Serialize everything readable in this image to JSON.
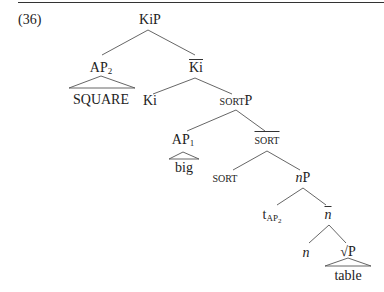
{
  "example": {
    "number": "(36)"
  },
  "tree": {
    "nodes": {
      "root": "KiP",
      "ap2": {
        "base": "AP",
        "sub": "2"
      },
      "ki_bar": "Ki",
      "square": "SQUARE",
      "ki": "Ki",
      "sortp": {
        "small_caps": "SORT",
        "suffix": "P"
      },
      "ap1": {
        "base": "AP",
        "sub": "1"
      },
      "sort_bar": "SORT",
      "big": "big",
      "sort": "SORT",
      "np": {
        "italic": "n",
        "suffix": "P"
      },
      "trace": {
        "base": "t",
        "sub_base": "AP",
        "sub_sub": "2"
      },
      "n_bar": "n",
      "n": "n",
      "rootp": {
        "symbol": "√",
        "suffix": "P"
      },
      "table": "table"
    },
    "edges": [
      [
        "KiP",
        "AP2"
      ],
      [
        "KiP",
        "Ki-bar"
      ],
      [
        "AP2",
        "SQUARE (triangle)"
      ],
      [
        "Ki-bar",
        "Ki"
      ],
      [
        "Ki-bar",
        "sortP"
      ],
      [
        "sortP",
        "AP1"
      ],
      [
        "sortP",
        "SORT-bar"
      ],
      [
        "AP1",
        "big (triangle)"
      ],
      [
        "SORT-bar",
        "SORT"
      ],
      [
        "SORT-bar",
        "nP"
      ],
      [
        "nP",
        "t_AP2"
      ],
      [
        "nP",
        "n-bar"
      ],
      [
        "n-bar",
        "n"
      ],
      [
        "n-bar",
        "√P"
      ],
      [
        "√P",
        "table (triangle)"
      ]
    ]
  }
}
